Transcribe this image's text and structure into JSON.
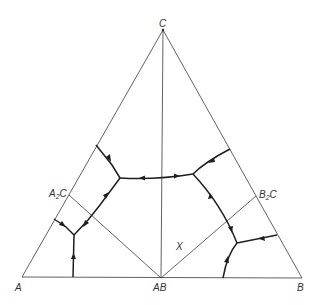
{
  "diagram": {
    "type": "ternary-phase-diagram",
    "labels": {
      "A": "A",
      "B": "B",
      "C": "C",
      "AB": "AB",
      "A2C_main": "A",
      "A2C_sub": "2",
      "A2C_end": "C",
      "B2C_main": "B",
      "B2C_sub": "2",
      "B2C_end": "C",
      "X": "X"
    },
    "vertices": {
      "A": [
        22,
        277
      ],
      "B": [
        302,
        278
      ],
      "C": [
        163,
        30
      ],
      "AB": [
        161,
        278
      ],
      "A2C": [
        69,
        195
      ],
      "B2C": [
        256,
        196
      ]
    },
    "invariant_points": {
      "E1": [
        120,
        178
      ],
      "E2": [
        193,
        174
      ],
      "E3": [
        74,
        235
      ],
      "E4": [
        237,
        243
      ]
    },
    "colors": {
      "line": "#3a3a3a",
      "boundary": "#1e1e1e",
      "background": "#ffffff"
    }
  }
}
